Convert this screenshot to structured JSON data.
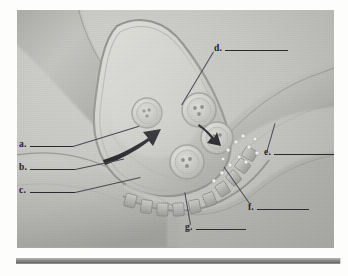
{
  "figure": {
    "alt": "Grayscale anatomical drawing of a synapse between a presynaptic axon terminal and a postsynaptic membrane",
    "plate_background": "#c9c9c6"
  },
  "labels": [
    {
      "id": "a",
      "text": "a.",
      "side": "left"
    },
    {
      "id": "b",
      "text": "b.",
      "side": "left"
    },
    {
      "id": "c",
      "text": "c.",
      "side": "left"
    },
    {
      "id": "d",
      "text": "d.",
      "side": "top-right"
    },
    {
      "id": "e",
      "text": "e.",
      "side": "right"
    },
    {
      "id": "f",
      "text": "f.",
      "side": "bottom-right"
    },
    {
      "id": "g",
      "text": "g.",
      "side": "bottom"
    }
  ],
  "structures": {
    "presynaptic_terminal": "presynaptic-axon-terminal",
    "postsynaptic_cell": "postsynaptic-dendrite",
    "vesicles": [
      "vesicle-1",
      "vesicle-2",
      "vesicle-3",
      "vesicle-4"
    ],
    "vesicle_granule_count": 3,
    "synaptic_cleft": "synaptic-cleft",
    "receptors": "postsynaptic-receptors",
    "arrows": [
      "transport-arrow-large",
      "fusion-arrow-small"
    ]
  },
  "colors": {
    "plate": "#c9c9c6",
    "cell_light": "#d6d6d2",
    "cell_mid": "#bcbcb8",
    "cell_dark": "#9e9e9b",
    "membrane": "#8b8b88",
    "ink": "#24242a",
    "bar": "#8d8d8b"
  }
}
